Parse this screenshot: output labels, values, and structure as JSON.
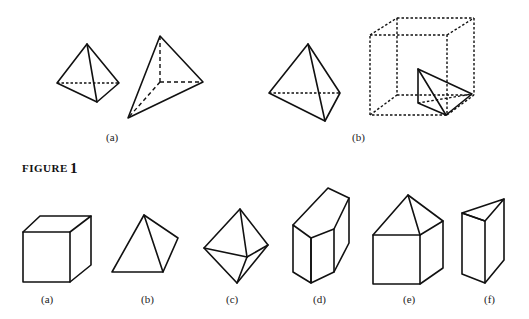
{
  "top_row": {
    "labels": {
      "a": "(a)",
      "b": "(b)"
    }
  },
  "figure_caption": {
    "word": "FIGURE",
    "number": "1"
  },
  "bottom_row": {
    "labels": [
      "(a)",
      "(b)",
      "(c)",
      "(d)",
      "(e)",
      "(f)"
    ]
  }
}
